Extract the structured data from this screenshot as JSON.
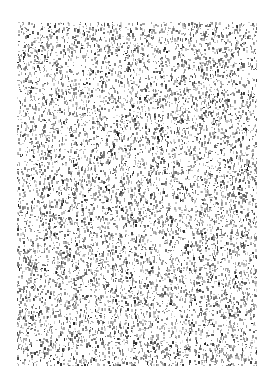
{
  "page": {
    "background": "#ffffff",
    "description": "Scanned document page with illegible dense noise texture"
  },
  "noise_region": {
    "x": 17,
    "y": 22,
    "width": 240,
    "height": 344,
    "ink_color": "#2a2a2a",
    "density": 0.33,
    "seed": 1337
  }
}
